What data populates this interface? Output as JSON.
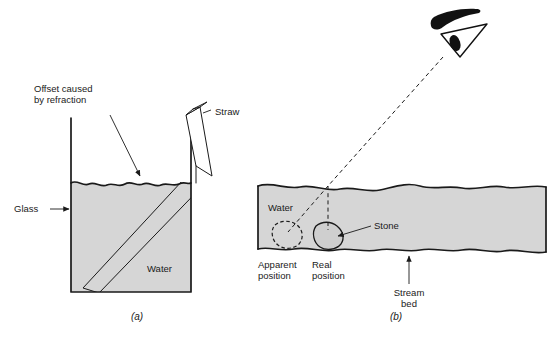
{
  "figure": {
    "background_color": "#ffffff",
    "water_fill_color": "#d6d6d6",
    "line_color": "#1a1a1a"
  },
  "panel_a": {
    "label": "(a)",
    "labels": {
      "offset_line1": "Offset caused",
      "offset_line2": "by refraction",
      "straw": "Straw",
      "glass": "Glass",
      "water": "Water"
    }
  },
  "panel_b": {
    "label": "(b)",
    "labels": {
      "water": "Water",
      "stone": "Stone",
      "apparent_line1": "Apparent",
      "apparent_line2": "position",
      "real_line1": "Real",
      "real_line2": "position",
      "stream_line1": "Stream",
      "stream_line2": "bed"
    }
  }
}
